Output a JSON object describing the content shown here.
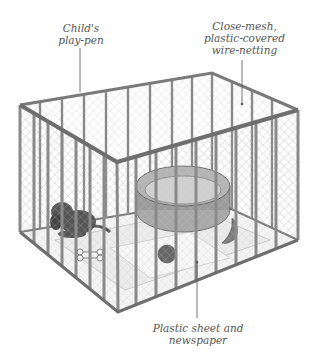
{
  "diagram": {
    "labels": [
      {
        "id": "playpen",
        "lines": [
          "Child's",
          "play-pen"
        ]
      },
      {
        "id": "mesh",
        "lines": [
          "Close-mesh,",
          "plastic-covered",
          "wire-netting"
        ]
      },
      {
        "id": "sheet",
        "lines": [
          "Plastic sheet and",
          "newspaper"
        ]
      }
    ],
    "colors": {
      "frame": "#8a8a8a",
      "frame_dark": "#5e5e5e",
      "mesh": "#c8c8c8",
      "floor": "#ececec",
      "bed": "#9a9a9a",
      "puppy": "#555555",
      "text": "#555555"
    }
  }
}
